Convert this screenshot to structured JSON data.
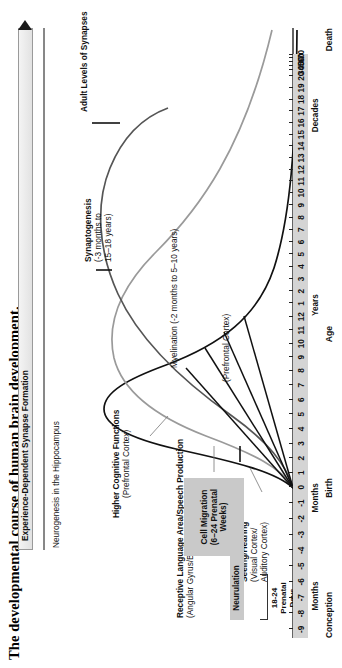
{
  "title": "The developmental course of human brain development.",
  "top_bar": {
    "label": "Experience-Dependent Synapse Formation",
    "arrow_icon": "right-arrow-icon"
  },
  "annotations": {
    "neurogenesis": "Neurogenesis in the Hippocampus",
    "higher_cognitive": {
      "main": "Higher Cognitive Functions",
      "sub": "(Prefrontal Cortex)"
    },
    "receptive_language": {
      "main": "Receptive Language Area/Speech Production",
      "sub": "(Angular Gyrus/Broca's Area)"
    },
    "seeing_hearing": {
      "main": "Seeing/Hearing",
      "sub1": "(Visual Cortex/",
      "sub2": "Auditory Cortex)"
    },
    "adult_levels": "Adult Levels of Synapses",
    "synaptogenesis": {
      "main": "Synaptogenesis",
      "sub1": "(-3 months to",
      "sub2": "15–18 years)"
    },
    "myelination": "Myelination (-2 months to 5–10 years)",
    "prefrontal_cortex": "(Prefrontal Cortex)"
  },
  "process_boxes": {
    "cell_migration": {
      "line1": "Cell Migration",
      "line2": "(6–24 Prenatal",
      "line3": "Weeks)"
    },
    "neurulation": "Neurulation",
    "prenatal_days": {
      "line1": "18-24",
      "line2": "Prenatal",
      "line3": "Days"
    }
  },
  "axis": {
    "title": "Age",
    "milestones": {
      "conception": "Conception",
      "birth": "Birth",
      "death": "Death"
    },
    "epochs": [
      {
        "label": "Months",
        "center_pct": 7.2
      },
      {
        "label": "Months",
        "center_pct": 24.0
      },
      {
        "label": "Years",
        "center_pct": 57.0
      },
      {
        "label": "Decades",
        "center_pct": 89.5
      }
    ],
    "ticks": [
      {
        "label": "-9",
        "pos_pct": 1.5
      },
      {
        "label": "-8",
        "pos_pct": 4.2
      },
      {
        "label": "-7",
        "pos_pct": 6.9
      },
      {
        "label": "-6",
        "pos_pct": 9.6
      },
      {
        "label": "-5",
        "pos_pct": 12.3
      },
      {
        "label": "-4",
        "pos_pct": 15.0
      },
      {
        "label": "-3",
        "pos_pct": 17.7
      },
      {
        "label": "-2",
        "pos_pct": 20.4
      },
      {
        "label": "-1",
        "pos_pct": 23.1
      },
      {
        "label": "0",
        "pos_pct": 25.8
      },
      {
        "label": "1",
        "pos_pct": 28.3
      },
      {
        "label": "2",
        "pos_pct": 30.8
      },
      {
        "label": "3",
        "pos_pct": 33.3
      },
      {
        "label": "4",
        "pos_pct": 35.8
      },
      {
        "label": "5",
        "pos_pct": 38.3
      },
      {
        "label": "6",
        "pos_pct": 40.8
      },
      {
        "label": "7",
        "pos_pct": 43.3
      },
      {
        "label": "8",
        "pos_pct": 45.8
      },
      {
        "label": "9",
        "pos_pct": 48.1
      },
      {
        "label": "10",
        "pos_pct": 50.4
      },
      {
        "label": "11",
        "pos_pct": 52.7
      },
      {
        "label": "12",
        "pos_pct": 55.0
      },
      {
        "label": "1",
        "pos_pct": 57.3
      },
      {
        "label": "2",
        "pos_pct": 59.4
      },
      {
        "label": "3",
        "pos_pct": 61.5
      },
      {
        "label": "4",
        "pos_pct": 63.6
      },
      {
        "label": "5",
        "pos_pct": 65.7
      },
      {
        "label": "6",
        "pos_pct": 67.8
      },
      {
        "label": "7",
        "pos_pct": 69.9
      },
      {
        "label": "8",
        "pos_pct": 72.0
      },
      {
        "label": "9",
        "pos_pct": 74.1
      },
      {
        "label": "10",
        "pos_pct": 76.2
      },
      {
        "label": "11",
        "pos_pct": 78.2
      },
      {
        "label": "12",
        "pos_pct": 80.2
      },
      {
        "label": "13",
        "pos_pct": 82.2
      },
      {
        "label": "14",
        "pos_pct": 84.2
      },
      {
        "label": "15",
        "pos_pct": 86.2
      },
      {
        "label": "16",
        "pos_pct": 88.2
      },
      {
        "label": "17",
        "pos_pct": 90.2
      },
      {
        "label": "18",
        "pos_pct": 92.2
      },
      {
        "label": "19",
        "pos_pct": 94.2
      },
      {
        "label": "20",
        "pos_pct": 96.2
      },
      {
        "label": "30",
        "pos_pct": 97.2
      },
      {
        "label": "40",
        "pos_pct": 98.0
      },
      {
        "label": "50",
        "pos_pct": 98.7
      },
      {
        "label": "60",
        "pos_pct": 99.3
      },
      {
        "label": "70",
        "pos_pct": 99.9
      }
    ]
  },
  "colors": {
    "curve_seeing_hearing": "#111111",
    "curve_language": "#9a9a9a",
    "curve_higher_cognitive": "#555555",
    "box_grey": "#c9c9c9",
    "axis_band": "#d4d4d4",
    "ink": "#111111"
  },
  "chart_data": {
    "type": "line",
    "title": "The developmental course of human brain development.",
    "xlabel": "Age",
    "ylabel": "Synapse Density / Developmental Activity",
    "grid": false,
    "legend": "inline-annotations",
    "xlim": [
      "-9 months (Conception)",
      "70 decades (Death)"
    ],
    "x_tick_labels": [
      "-9",
      "-8",
      "-7",
      "-6",
      "-5",
      "-4",
      "-3",
      "-2",
      "-1",
      "0",
      "1",
      "2",
      "3",
      "4",
      "5",
      "6",
      "7",
      "8",
      "9",
      "10",
      "11",
      "12",
      "1",
      "2",
      "3",
      "4",
      "5",
      "6",
      "7",
      "8",
      "9",
      "10",
      "11",
      "12",
      "13",
      "14",
      "15",
      "16",
      "17",
      "18",
      "19",
      "20",
      "30",
      "40",
      "50",
      "60",
      "70"
    ],
    "x_epoch_groups": [
      "Months (prenatal)",
      "Months (postnatal)",
      "Years",
      "Decades"
    ],
    "series": [
      {
        "name": "Seeing/Hearing (Visual Cortex/Auditory Cortex)",
        "color": "#111111",
        "peak_age": "3-4 months",
        "description": "Earliest and sharpest rise and prune; synapse density peaks near 3-4 postnatal months then declines to adult levels by mid-childhood."
      },
      {
        "name": "Receptive Language Area/Speech Production (Angular Gyrus/Broca's Area)",
        "color": "#9a9a9a",
        "peak_age": "8-9 months",
        "description": "Intermediate trajectory; peaks later than sensory cortices, prunes through late childhood."
      },
      {
        "name": "Higher Cognitive Functions (Prefrontal Cortex)",
        "color": "#555555",
        "peak_age": "1-2 years",
        "description": "Latest peak and longest pruning period, reaching adult levels of synapses in adolescence."
      }
    ],
    "annotations": [
      {
        "text": "Experience-Dependent Synapse Formation",
        "span": "birth to death",
        "style": "arrow-bar"
      },
      {
        "text": "Neurogenesis in the Hippocampus",
        "span": "prenatal to death"
      },
      {
        "text": "Adult Levels of Synapses",
        "span": "adolescence onward"
      },
      {
        "text": "Synaptogenesis (-3 months to 15–18 years)"
      },
      {
        "text": "Myelination (-2 months to 5–10 years)"
      },
      {
        "text": "Cell Migration (6–24 Prenatal Weeks)"
      },
      {
        "text": "Neurulation"
      },
      {
        "text": "18-24 Prenatal Days"
      }
    ]
  }
}
